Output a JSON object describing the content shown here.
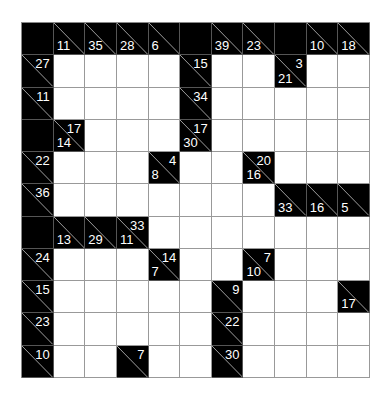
{
  "puzzle": {
    "type": "kakuro",
    "rows": 11,
    "cols": 11,
    "colors": {
      "block": "#000000",
      "empty": "#ffffff",
      "grid_line": "#999999",
      "clue_text": "#ffffff"
    },
    "grid": [
      [
        {
          "t": "b"
        },
        {
          "t": "c",
          "d": "11"
        },
        {
          "t": "c",
          "d": "35"
        },
        {
          "t": "c",
          "d": "28"
        },
        {
          "t": "c",
          "d": "6"
        },
        {
          "t": "b"
        },
        {
          "t": "c",
          "d": "39"
        },
        {
          "t": "c",
          "d": "23"
        },
        {
          "t": "b"
        },
        {
          "t": "c",
          "d": "10"
        },
        {
          "t": "c",
          "d": "18"
        }
      ],
      [
        {
          "t": "c",
          "a": "27"
        },
        {
          "t": "w"
        },
        {
          "t": "w"
        },
        {
          "t": "w"
        },
        {
          "t": "w"
        },
        {
          "t": "c",
          "a": "15"
        },
        {
          "t": "w"
        },
        {
          "t": "w"
        },
        {
          "t": "c",
          "a": "3",
          "d": "21"
        },
        {
          "t": "w"
        },
        {
          "t": "w"
        }
      ],
      [
        {
          "t": "c",
          "a": "11"
        },
        {
          "t": "w"
        },
        {
          "t": "w"
        },
        {
          "t": "w"
        },
        {
          "t": "w"
        },
        {
          "t": "c",
          "a": "34"
        },
        {
          "t": "w"
        },
        {
          "t": "w"
        },
        {
          "t": "w"
        },
        {
          "t": "w"
        },
        {
          "t": "w"
        }
      ],
      [
        {
          "t": "b"
        },
        {
          "t": "c",
          "a": "17",
          "d": "14"
        },
        {
          "t": "w"
        },
        {
          "t": "w"
        },
        {
          "t": "w"
        },
        {
          "t": "c",
          "a": "17",
          "d": "30"
        },
        {
          "t": "w"
        },
        {
          "t": "w"
        },
        {
          "t": "w"
        },
        {
          "t": "w"
        },
        {
          "t": "w"
        }
      ],
      [
        {
          "t": "c",
          "a": "22"
        },
        {
          "t": "w"
        },
        {
          "t": "w"
        },
        {
          "t": "w"
        },
        {
          "t": "c",
          "a": "4",
          "d": "8"
        },
        {
          "t": "w"
        },
        {
          "t": "w"
        },
        {
          "t": "c",
          "a": "20",
          "d": "16"
        },
        {
          "t": "w"
        },
        {
          "t": "w"
        },
        {
          "t": "w"
        }
      ],
      [
        {
          "t": "c",
          "a": "36"
        },
        {
          "t": "w"
        },
        {
          "t": "w"
        },
        {
          "t": "w"
        },
        {
          "t": "w"
        },
        {
          "t": "w"
        },
        {
          "t": "w"
        },
        {
          "t": "w"
        },
        {
          "t": "c",
          "d": "33"
        },
        {
          "t": "c",
          "d": "16"
        },
        {
          "t": "c",
          "d": "5"
        }
      ],
      [
        {
          "t": "b"
        },
        {
          "t": "c",
          "d": "13"
        },
        {
          "t": "c",
          "d": "29"
        },
        {
          "t": "c",
          "a": "33",
          "d": "11"
        },
        {
          "t": "w"
        },
        {
          "t": "w"
        },
        {
          "t": "w"
        },
        {
          "t": "w"
        },
        {
          "t": "w"
        },
        {
          "t": "w"
        },
        {
          "t": "w"
        }
      ],
      [
        {
          "t": "c",
          "a": "24"
        },
        {
          "t": "w"
        },
        {
          "t": "w"
        },
        {
          "t": "w"
        },
        {
          "t": "c",
          "a": "14",
          "d": "7"
        },
        {
          "t": "w"
        },
        {
          "t": "w"
        },
        {
          "t": "c",
          "a": "7",
          "d": "10"
        },
        {
          "t": "w"
        },
        {
          "t": "w"
        },
        {
          "t": "w"
        }
      ],
      [
        {
          "t": "c",
          "a": "15"
        },
        {
          "t": "w"
        },
        {
          "t": "w"
        },
        {
          "t": "w"
        },
        {
          "t": "w"
        },
        {
          "t": "w"
        },
        {
          "t": "c",
          "a": "9"
        },
        {
          "t": "w"
        },
        {
          "t": "w"
        },
        {
          "t": "w"
        },
        {
          "t": "c",
          "d": "17"
        }
      ],
      [
        {
          "t": "c",
          "a": "23"
        },
        {
          "t": "w"
        },
        {
          "t": "w"
        },
        {
          "t": "w"
        },
        {
          "t": "w"
        },
        {
          "t": "w"
        },
        {
          "t": "c",
          "a": "22"
        },
        {
          "t": "w"
        },
        {
          "t": "w"
        },
        {
          "t": "w"
        },
        {
          "t": "w"
        }
      ],
      [
        {
          "t": "c",
          "a": "10"
        },
        {
          "t": "w"
        },
        {
          "t": "w"
        },
        {
          "t": "c",
          "a": "7"
        },
        {
          "t": "w"
        },
        {
          "t": "w"
        },
        {
          "t": "c",
          "a": "30"
        },
        {
          "t": "w"
        },
        {
          "t": "w"
        },
        {
          "t": "w"
        },
        {
          "t": "w"
        }
      ]
    ]
  }
}
